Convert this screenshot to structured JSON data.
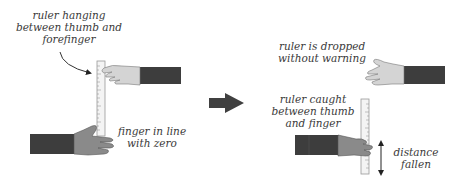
{
  "diagram": {
    "before": {
      "label_ruler_hanging": "ruler hanging\nbetween thumb and\nforefinger",
      "label_finger_zero": "finger in line\nwith zero"
    },
    "after": {
      "label_dropped": "ruler is dropped\nwithout warning",
      "label_caught": "ruler caught\nbetween thumb\nand finger",
      "label_distance": "distance\nfallen"
    },
    "colors": {
      "sleeve": "#3d3d3d",
      "hand_light": "#d4d4d4",
      "hand_dark": "#8a8a8a",
      "ruler": "#f4f4f4",
      "ruler_outline": "#9a9a9a",
      "arrow": "#404040",
      "text": "#3a3a3a"
    }
  }
}
